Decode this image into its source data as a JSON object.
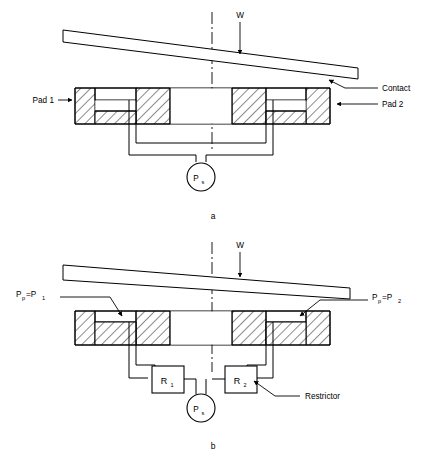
{
  "figure": {
    "background_color": "#ffffff",
    "line_color": "#000000"
  },
  "diagram_a": {
    "caption": "a",
    "load_label": "W",
    "supply_label": "P",
    "supply_sub": "s",
    "annotations": [
      {
        "name": "pad-1",
        "text": "Pad 1"
      },
      {
        "name": "contact",
        "text": "Contact"
      },
      {
        "name": "pad-2",
        "text": "Pad 2"
      }
    ]
  },
  "diagram_b": {
    "caption": "b",
    "load_label": "W",
    "supply_label": "P",
    "supply_sub": "s",
    "restrictor_label": "Restrictor",
    "resistor_1": {
      "label": "R",
      "sub": "1"
    },
    "resistor_2": {
      "label": "R",
      "sub": "2"
    },
    "pressure_left": {
      "main": "P",
      "sub1": "p",
      "eq": "=P",
      "sub2": "1"
    },
    "pressure_right": {
      "main": "P",
      "sub1": "p",
      "eq": "=P",
      "sub2": "2"
    }
  }
}
